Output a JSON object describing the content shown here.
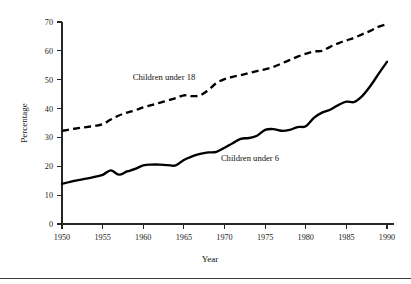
{
  "chart_data": {
    "type": "line",
    "title": "",
    "xlabel": "Year",
    "ylabel": "Percentage",
    "xlim": [
      1950,
      1990
    ],
    "ylim": [
      0,
      70
    ],
    "grid": false,
    "legend_position": "inline-annotations",
    "xticks": [
      1950,
      1955,
      1960,
      1965,
      1970,
      1975,
      1980,
      1985,
      1990
    ],
    "xtick_labels": [
      "1950",
      "1955",
      "1960",
      "1965",
      "1970",
      "1975",
      "1980",
      "1985",
      "1990"
    ],
    "yticks": [
      0,
      10,
      20,
      30,
      40,
      50,
      60,
      70
    ],
    "ytick_labels": [
      "0",
      "10",
      "20",
      "30",
      "40",
      "50",
      "60",
      "70"
    ],
    "x": [
      1950,
      1951,
      1952,
      1953,
      1954,
      1955,
      1956,
      1957,
      1958,
      1959,
      1960,
      1961,
      1962,
      1963,
      1964,
      1965,
      1966,
      1967,
      1968,
      1969,
      1970,
      1971,
      1972,
      1973,
      1974,
      1975,
      1976,
      1977,
      1978,
      1979,
      1980,
      1981,
      1982,
      1983,
      1984,
      1985,
      1986,
      1987,
      1988,
      1989,
      1990
    ],
    "series": [
      {
        "name": "Children under 18",
        "style": "dashed",
        "color": "#000000",
        "label_text": "Children under 18",
        "values": [
          32.3,
          32.8,
          33.2,
          33.6,
          34.0,
          34.6,
          36.2,
          37.6,
          38.6,
          39.4,
          40.4,
          41.2,
          42.0,
          42.8,
          43.6,
          44.6,
          44.3,
          44.6,
          46.4,
          48.8,
          50.2,
          51.0,
          51.6,
          52.3,
          53.0,
          53.6,
          54.4,
          55.6,
          56.8,
          58.0,
          59.0,
          59.8,
          60.0,
          61.4,
          62.6,
          63.6,
          64.6,
          65.8,
          67.0,
          68.4,
          69.3
        ]
      },
      {
        "name": "Children under 6",
        "style": "solid",
        "color": "#000000",
        "label_text": "Children under 6",
        "values": [
          13.9,
          14.6,
          15.2,
          15.7,
          16.3,
          17.0,
          18.6,
          17.1,
          18.2,
          19.1,
          20.3,
          20.6,
          20.6,
          20.4,
          20.3,
          22.2,
          23.4,
          24.3,
          24.8,
          25.0,
          26.4,
          28.0,
          29.5,
          29.8,
          30.6,
          32.6,
          32.9,
          32.3,
          32.6,
          33.6,
          33.9,
          36.8,
          38.6,
          39.6,
          41.2,
          42.4,
          42.3,
          44.5,
          48.0,
          52.2,
          56.2
        ]
      }
    ]
  },
  "annotations": {
    "under18_label": "Children under 18",
    "under6_label": "Children under 6"
  }
}
